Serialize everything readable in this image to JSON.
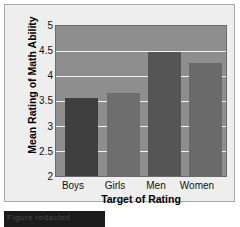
{
  "chart_data": {
    "type": "bar",
    "title": "",
    "xlabel": "Target of Rating",
    "ylabel": "Mean Rating of Math Ability",
    "categories": [
      "Boys",
      "Girls",
      "Men",
      "Women"
    ],
    "values": [
      3.56,
      3.66,
      4.48,
      4.25
    ],
    "ylim": [
      2,
      5
    ],
    "yticks": [
      5,
      4.5,
      4,
      3.5,
      3,
      2.5,
      2
    ],
    "ytick_labels": [
      "5",
      "4.5",
      "4",
      "3.5",
      "3",
      "2.5",
      "2"
    ],
    "grid": true,
    "legend": "none",
    "bar_colors": [
      "#3f3f3f",
      "#6e6e6e",
      "#555555",
      "#6a6a6a"
    ],
    "plot_background": "#8e8e8e",
    "gridline_color": "#f2f2f2",
    "panel_background": "#eeeeee",
    "text_color": "#111111"
  },
  "caption": {
    "strip_text": "Figure redacted"
  }
}
